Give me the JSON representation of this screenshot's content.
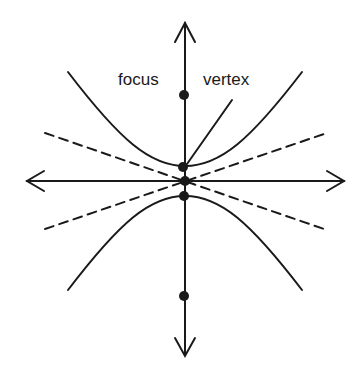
{
  "diagram": {
    "labels": {
      "focus": "focus",
      "vertex": "vertex"
    },
    "colors": {
      "stroke": "#1a1a1a",
      "background": "#ffffff"
    },
    "elements": {
      "axes": [
        "horizontal-axis",
        "vertical-axis"
      ],
      "branches": [
        "upper-branch",
        "lower-branch"
      ],
      "asymptotes": [
        "asymptote-positive-slope",
        "asymptote-negative-slope"
      ],
      "points": [
        "upper-focus",
        "upper-vertex",
        "center",
        "lower-vertex",
        "lower-focus"
      ]
    }
  }
}
